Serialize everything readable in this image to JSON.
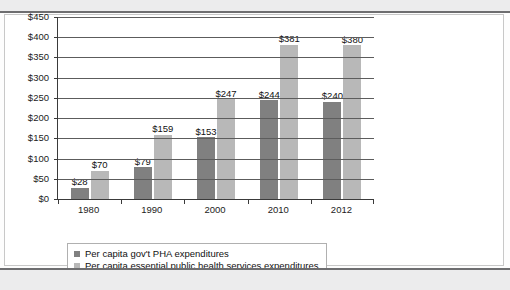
{
  "chart_data": {
    "type": "bar",
    "title": "",
    "subtitle": "",
    "xlabel": "",
    "ylabel": "",
    "categories": [
      "1980",
      "1990",
      "2000",
      "2010",
      "2012"
    ],
    "series": [
      {
        "name": "Per capita gov't PHA expenditures",
        "color": "#808080",
        "values": [
          28,
          79,
          153,
          244,
          240
        ],
        "labels": [
          "$28",
          "$79",
          "$153",
          "$244",
          "$240"
        ]
      },
      {
        "name": "Per capita essential public health services expenditures",
        "color": "#b8b8b8",
        "values": [
          70,
          159,
          247,
          381,
          380
        ],
        "labels": [
          "$70",
          "$159",
          "$247",
          "$381",
          "$380"
        ]
      }
    ],
    "ylim": [
      0,
      450
    ],
    "ytick_values": [
      0,
      50,
      100,
      150,
      200,
      250,
      300,
      350,
      400,
      450
    ],
    "ytick_labels": [
      "$0",
      "$50",
      "$100",
      "$150",
      "$200",
      "$250",
      "$300",
      "$350",
      "$400",
      "$450"
    ],
    "grid": true,
    "legend_position": "bottom"
  }
}
